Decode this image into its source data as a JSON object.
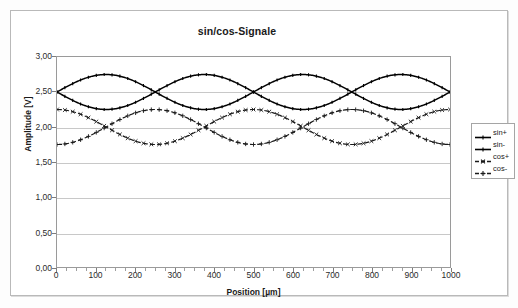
{
  "chart_data": {
    "type": "line",
    "title": "sin/cos-Signale",
    "xlabel": "Position [µm]",
    "ylabel": "Amplitude [V]",
    "xlim": [
      0,
      1000
    ],
    "ylim": [
      0,
      3.0
    ],
    "grid": true,
    "legend_position": "right",
    "x_ticks": [
      0,
      100,
      200,
      300,
      400,
      500,
      600,
      700,
      800,
      900,
      1000
    ],
    "x_tick_labels": [
      "0",
      "100",
      "200",
      "300",
      "400",
      "500",
      "600",
      "700",
      "800",
      "900",
      "1000"
    ],
    "y_ticks": [
      0.0,
      0.5,
      1.0,
      1.5,
      2.0,
      2.5,
      3.0
    ],
    "y_tick_labels": [
      "0,00",
      "0,50",
      "1,00",
      "1,50",
      "2,00",
      "2,50",
      "3,00"
    ],
    "x": [
      0,
      20,
      40,
      60,
      80,
      100,
      120,
      140,
      160,
      180,
      200,
      220,
      240,
      260,
      280,
      300,
      320,
      340,
      360,
      380,
      400,
      420,
      440,
      460,
      480,
      500,
      520,
      540,
      560,
      580,
      600,
      620,
      640,
      660,
      680,
      700,
      720,
      740,
      760,
      780,
      800,
      820,
      840,
      860,
      880,
      900,
      920,
      940,
      960,
      980,
      1000
    ],
    "series": [
      {
        "name": "sin+",
        "marker": "dash-line",
        "style": "solid",
        "color": "#000000",
        "offset": 2.5,
        "amplitude": 0.25,
        "phase_deg": 0,
        "periods": 2,
        "values": [
          2.5,
          2.58,
          2.65,
          2.7,
          2.74,
          2.75,
          2.74,
          2.71,
          2.66,
          2.6,
          2.53,
          2.47,
          2.4,
          2.34,
          2.29,
          2.26,
          2.25,
          2.26,
          2.29,
          2.34,
          2.4,
          2.47,
          2.53,
          2.6,
          2.66,
          2.5,
          2.58,
          2.65,
          2.7,
          2.74,
          2.75,
          2.74,
          2.71,
          2.66,
          2.6,
          2.53,
          2.47,
          2.4,
          2.34,
          2.29,
          2.26,
          2.25,
          2.26,
          2.29,
          2.34,
          2.4,
          2.47,
          2.53,
          2.6,
          2.66,
          2.5
        ]
      },
      {
        "name": "sin-",
        "marker": "dash-line",
        "style": "solid",
        "color": "#000000",
        "offset": 2.5,
        "amplitude": -0.25,
        "phase_deg": 0,
        "periods": 2,
        "values": [
          2.5,
          2.42,
          2.35,
          2.3,
          2.26,
          2.25,
          2.26,
          2.29,
          2.34,
          2.4,
          2.47,
          2.53,
          2.6,
          2.66,
          2.71,
          2.74,
          2.75,
          2.74,
          2.71,
          2.66,
          2.6,
          2.53,
          2.47,
          2.4,
          2.34,
          2.5,
          2.42,
          2.35,
          2.3,
          2.26,
          2.25,
          2.26,
          2.29,
          2.34,
          2.4,
          2.47,
          2.53,
          2.6,
          2.66,
          2.71,
          2.74,
          2.75,
          2.74,
          2.71,
          2.66,
          2.6,
          2.53,
          2.47,
          2.4,
          2.34,
          2.5
        ]
      },
      {
        "name": "cos+",
        "marker": "x-dash",
        "style": "dashed",
        "color": "#1a1a1a",
        "offset": 2.0,
        "amplitude": 0.25,
        "phase_deg": 90,
        "periods": 2,
        "values": [
          2.25,
          2.24,
          2.22,
          2.18,
          2.14,
          2.09,
          2.03,
          1.97,
          1.91,
          1.86,
          1.82,
          1.78,
          1.76,
          1.75,
          1.76,
          1.78,
          1.82,
          1.86,
          1.91,
          1.97,
          2.03,
          2.09,
          2.14,
          2.18,
          2.22,
          2.25,
          2.24,
          2.22,
          2.18,
          2.14,
          2.09,
          2.03,
          1.97,
          1.91,
          1.86,
          1.82,
          1.78,
          1.76,
          1.75,
          1.76,
          1.78,
          1.82,
          1.86,
          1.91,
          1.97,
          2.03,
          2.09,
          2.14,
          2.18,
          2.22,
          2.25
        ]
      },
      {
        "name": "cos-",
        "marker": "plus-dash",
        "style": "dashed",
        "color": "#1a1a1a",
        "offset": 2.0,
        "amplitude": -0.25,
        "phase_deg": 90,
        "periods": 2,
        "values": [
          1.75,
          1.76,
          1.78,
          1.82,
          1.86,
          1.91,
          1.97,
          2.03,
          2.09,
          2.14,
          2.18,
          2.22,
          2.24,
          2.25,
          2.24,
          2.22,
          2.18,
          2.14,
          2.09,
          2.03,
          1.97,
          1.91,
          1.86,
          1.82,
          1.78,
          1.75,
          1.76,
          1.78,
          1.82,
          1.86,
          1.91,
          1.97,
          2.03,
          2.09,
          2.14,
          2.18,
          2.22,
          2.24,
          2.25,
          2.24,
          2.22,
          2.18,
          2.14,
          2.09,
          2.03,
          1.97,
          1.91,
          1.86,
          1.82,
          1.78,
          1.75
        ]
      }
    ],
    "legend": [
      "sin+",
      "sin-",
      "cos+",
      "cos-"
    ]
  }
}
